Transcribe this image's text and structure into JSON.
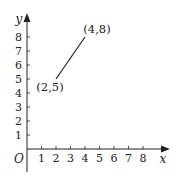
{
  "chart_data": {
    "type": "line",
    "title": "",
    "xlabel": "x",
    "ylabel": "y",
    "origin_label": "O",
    "xlim": [
      0,
      9
    ],
    "ylim": [
      0,
      9
    ],
    "x_ticks": [
      "1",
      "2",
      "3",
      "4",
      "5",
      "6",
      "7",
      "8"
    ],
    "y_ticks": [
      "1",
      "2",
      "3",
      "4",
      "5",
      "6",
      "7",
      "8"
    ],
    "grid": false,
    "legend": null,
    "series": [
      {
        "name": "segment",
        "points": [
          {
            "x": 2,
            "y": 5,
            "label": "(2,5)"
          },
          {
            "x": 4,
            "y": 8,
            "label": "(4,8)"
          }
        ]
      }
    ],
    "colors": {
      "axis": "#222222",
      "line": "#222222",
      "text": "#222222"
    }
  }
}
